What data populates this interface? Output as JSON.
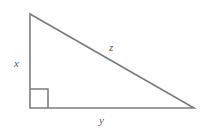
{
  "figure": {
    "kind": "right-triangle-diagram",
    "background_color": "#ffffff",
    "stroke_color": "#7b7c7e",
    "label_color": "#58595b",
    "stroke_width": 1.6,
    "width": 208,
    "height": 137,
    "vertices": {
      "top": {
        "x": 30,
        "y": 14
      },
      "bottom_left": {
        "x": 30,
        "y": 108
      },
      "bottom_right": {
        "x": 194,
        "y": 108
      }
    },
    "right_angle_marker": {
      "at_vertex": "bottom_left",
      "x": 30,
      "y": 89,
      "size": 18
    },
    "sides": [
      {
        "name": "vertical-leg",
        "label": "x",
        "label_x": 14,
        "label_y": 58
      },
      {
        "name": "horizontal-leg",
        "label": "y",
        "label_x": 99,
        "label_y": 115
      },
      {
        "name": "hypotenuse",
        "label": "z",
        "label_x": 109,
        "label_y": 42
      }
    ]
  }
}
